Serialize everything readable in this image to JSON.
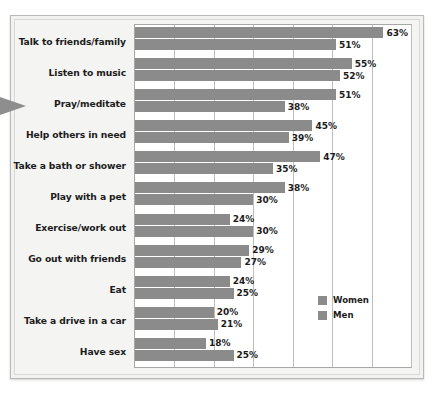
{
  "chart_data": {
    "type": "bar",
    "orientation": "horizontal",
    "title": "",
    "xlabel": "",
    "ylabel": "",
    "xlim": [
      0,
      70
    ],
    "grid": true,
    "gridlines": [
      0,
      10,
      20,
      30,
      40,
      50,
      60,
      70
    ],
    "legend_position": "middle-right",
    "categories": [
      "Talk to friends/family",
      "Listen to music",
      "Pray/meditate",
      "Help others in need",
      "Take a bath or shower",
      "Play with a pet",
      "Exercise/work out",
      "Go out with friends",
      "Eat",
      "Take a drive in a car",
      "Have sex"
    ],
    "series": [
      {
        "name": "Women",
        "color": "#8b8b8b",
        "values": [
          63,
          55,
          51,
          45,
          47,
          38,
          24,
          29,
          24,
          20,
          18
        ],
        "labels": [
          "63%",
          "55%",
          "51%",
          "45%",
          "47%",
          "38%",
          "24%",
          "29%",
          "24%",
          "20%",
          "18%"
        ]
      },
      {
        "name": "Men",
        "color": "#8b8b8b",
        "values": [
          51,
          52,
          38,
          39,
          35,
          30,
          30,
          27,
          25,
          21,
          25
        ],
        "labels": [
          "51%",
          "52%",
          "38%",
          "39%",
          "35%",
          "30%",
          "30%",
          "27%",
          "25%",
          "21%",
          "25%"
        ]
      }
    ]
  },
  "legend": {
    "items": [
      {
        "label": "Women"
      },
      {
        "label": "Men"
      }
    ]
  },
  "colors": {
    "bar": "#8b8b8b",
    "plot_background": "#ffffff",
    "figure_background": "#f3f3f2",
    "gridline": "#bdbdbb",
    "pointer": "#8e8e8e"
  }
}
